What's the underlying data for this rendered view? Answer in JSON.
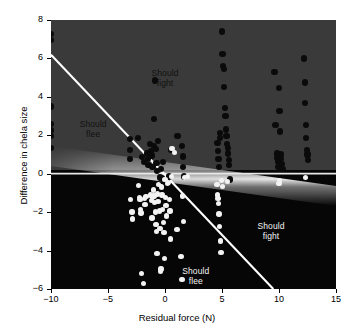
{
  "figure": {
    "background": "#ffffff",
    "plot_bg_upper": "#3a3a3a",
    "plot_bg_lower": "#060606",
    "line_color": "#ffffff"
  },
  "axes": {
    "x": {
      "title": "Residual force (N)",
      "ticks": [
        -10,
        -5,
        0,
        5,
        10,
        15
      ],
      "tick_labels": [
        "−10",
        "−5",
        "0",
        "5",
        "10",
        "15"
      ],
      "min": -10,
      "max": 15
    },
    "y": {
      "title": "Difference in chela size",
      "ticks": [
        8,
        6,
        4,
        2,
        0,
        -2,
        -4,
        -6
      ],
      "tick_labels": [
        "8",
        "6",
        "4",
        "2",
        "0",
        "−2",
        "−4",
        "−6"
      ],
      "min": -6,
      "max": 8
    }
  },
  "annotations": [
    {
      "name": "should-fight-upper",
      "text": "Should\nfight",
      "x": 0.0,
      "y": 5.0,
      "tone": "on-gray"
    },
    {
      "name": "should-flee-upper",
      "text": "Should\nflee",
      "x": -6.3,
      "y": 2.35,
      "tone": "on-gray"
    },
    {
      "name": "should-fight-lower",
      "text": "Should\nfight",
      "x": 9.3,
      "y": -3.0,
      "tone": "on-black"
    },
    {
      "name": "should-flee-lower",
      "text": "Should\nflee",
      "x": 2.7,
      "y": -5.3,
      "tone": "on-black"
    }
  ],
  "chart_data": {
    "type": "scatter",
    "title": "",
    "xlabel": "Residual force (N)",
    "ylabel": "Difference in chela size",
    "xlim": [
      -10,
      15
    ],
    "ylim": [
      -6,
      8
    ],
    "grid": false,
    "legend": null,
    "series": [
      {
        "name": "Winner larger chela (dark points)",
        "marker": "filled-circle",
        "color": "#0a0a0a",
        "points": [
          [
            -10.0,
            7.25
          ],
          [
            -10.0,
            6.95
          ],
          [
            -10.0,
            3.5
          ],
          [
            -10.0,
            2.6
          ],
          [
            -10.0,
            2.25
          ],
          [
            -10.0,
            1.95
          ],
          [
            -10.0,
            1.35
          ],
          [
            -3.05,
            1.8
          ],
          [
            -3.05,
            1.25
          ],
          [
            -3.05,
            0.75
          ],
          [
            -2.35,
            1.85
          ],
          [
            -2.0,
            0.85
          ],
          [
            -1.85,
            0.6
          ],
          [
            -1.55,
            1.05
          ],
          [
            -1.5,
            0.75
          ],
          [
            -1.45,
            0.45
          ],
          [
            -1.3,
            1.55
          ],
          [
            -1.2,
            1.2
          ],
          [
            -1.15,
            0.95
          ],
          [
            -1.1,
            0.35
          ],
          [
            -1.0,
            1.45
          ],
          [
            -0.95,
            2.85
          ],
          [
            -0.9,
            4.85
          ],
          [
            -0.8,
            1.3
          ],
          [
            -0.75,
            0.55
          ],
          [
            -0.7,
            0.15
          ],
          [
            -0.6,
            1.7
          ],
          [
            -0.45,
            -0.2
          ],
          [
            -0.35,
            0.25
          ],
          [
            -0.25,
            -0.25
          ],
          [
            -0.2,
            0.6
          ],
          [
            0.15,
            -0.35
          ],
          [
            0.35,
            -0.15
          ],
          [
            0.55,
            1.25
          ],
          [
            1.1,
            1.95
          ],
          [
            1.5,
            1.45
          ],
          [
            1.55,
            0.9
          ],
          [
            1.6,
            0.35
          ],
          [
            1.65,
            -0.15
          ],
          [
            4.6,
            1.6
          ],
          [
            4.65,
            1.2
          ],
          [
            4.7,
            0.75
          ],
          [
            4.75,
            0.35
          ],
          [
            4.8,
            2.1
          ],
          [
            4.85,
            1.85
          ],
          [
            5.0,
            7.4
          ],
          [
            5.05,
            6.25
          ],
          [
            5.1,
            5.6
          ],
          [
            5.15,
            5.45
          ],
          [
            5.2,
            4.5
          ],
          [
            5.25,
            3.4
          ],
          [
            5.3,
            3.0
          ],
          [
            5.35,
            2.3
          ],
          [
            5.4,
            1.95
          ],
          [
            5.45,
            1.55
          ],
          [
            5.5,
            1.35
          ],
          [
            5.55,
            1.05
          ],
          [
            5.6,
            0.7
          ],
          [
            5.65,
            0.45
          ],
          [
            5.7,
            -0.3
          ],
          [
            9.6,
            5.3
          ],
          [
            9.7,
            2.55
          ],
          [
            9.8,
            1.05
          ],
          [
            9.85,
            0.8
          ],
          [
            9.9,
            0.6
          ],
          [
            9.95,
            0.35
          ],
          [
            10.0,
            4.45
          ],
          [
            10.05,
            3.25
          ],
          [
            10.1,
            2.2
          ],
          [
            10.15,
            1.0
          ],
          [
            10.2,
            0.75
          ],
          [
            10.25,
            0.5
          ],
          [
            10.3,
            0.25
          ],
          [
            12.2,
            6.0
          ],
          [
            12.25,
            4.75
          ],
          [
            12.3,
            3.7
          ],
          [
            12.35,
            2.55
          ],
          [
            12.4,
            1.85
          ],
          [
            12.45,
            1.25
          ],
          [
            12.5,
            1.0
          ],
          [
            12.55,
            0.7
          ]
        ]
      },
      {
        "name": "Loser larger chela (open points)",
        "marker": "open-circle",
        "color": "#f2f2f2",
        "points": [
          [
            -3.0,
            -1.35
          ],
          [
            -2.9,
            -2.0
          ],
          [
            -2.85,
            -2.35
          ],
          [
            -2.3,
            -0.6
          ],
          [
            -2.25,
            -1.25
          ],
          [
            -2.2,
            -1.35
          ],
          [
            -2.15,
            -1.85
          ],
          [
            -2.1,
            -2.05
          ],
          [
            -2.05,
            -5.2
          ],
          [
            -1.9,
            -5.7
          ],
          [
            -1.8,
            -1.3
          ],
          [
            -1.75,
            -1.6
          ],
          [
            -1.65,
            -1.2
          ],
          [
            -1.25,
            -1.1
          ],
          [
            -1.2,
            -1.4
          ],
          [
            -1.15,
            -2.3
          ],
          [
            -1.1,
            -1.25
          ],
          [
            -1.0,
            -0.85
          ],
          [
            -0.95,
            -1.15
          ],
          [
            -0.9,
            -1.5
          ],
          [
            -0.85,
            -2.0
          ],
          [
            -0.8,
            -2.65
          ],
          [
            -0.75,
            -3.0
          ],
          [
            -0.7,
            -4.15
          ],
          [
            -0.65,
            -1.05
          ],
          [
            -0.6,
            -1.45
          ],
          [
            -0.55,
            -0.55
          ],
          [
            -0.5,
            -1.95
          ],
          [
            -0.45,
            -2.85
          ],
          [
            -0.4,
            -5.1
          ],
          [
            -0.35,
            -4.95
          ],
          [
            -0.3,
            -0.7
          ],
          [
            -0.25,
            -1.1
          ],
          [
            -0.2,
            -1.85
          ],
          [
            -0.15,
            -2.55
          ],
          [
            -0.1,
            -3.05
          ],
          [
            -0.05,
            -4.4
          ],
          [
            0.0,
            -0.3
          ],
          [
            0.05,
            -1.25
          ],
          [
            0.1,
            -1.65
          ],
          [
            0.15,
            -2.2
          ],
          [
            0.2,
            -0.5
          ],
          [
            0.3,
            -0.45
          ],
          [
            0.4,
            -1.35
          ],
          [
            0.45,
            -1.95
          ],
          [
            0.5,
            -3.4
          ],
          [
            0.55,
            -0.15
          ],
          [
            0.6,
            1.3
          ],
          [
            0.85,
            1.1
          ],
          [
            1.05,
            -2.9
          ],
          [
            1.4,
            -4.3
          ],
          [
            1.5,
            -5.5
          ],
          [
            1.55,
            -1.15
          ],
          [
            1.6,
            -2.5
          ],
          [
            1.7,
            -0.2
          ],
          [
            2.0,
            -0.15
          ],
          [
            4.55,
            -0.55
          ],
          [
            4.6,
            -1.1
          ],
          [
            4.65,
            -1.3
          ],
          [
            4.7,
            -1.55
          ],
          [
            4.75,
            -2.1
          ],
          [
            4.8,
            -2.75
          ],
          [
            4.85,
            -3.5
          ],
          [
            4.9,
            -4.1
          ],
          [
            4.95,
            -0.35
          ],
          [
            5.05,
            -0.65
          ],
          [
            5.5,
            -0.4
          ],
          [
            10.0,
            -0.5
          ],
          [
            10.05,
            -0.35
          ],
          [
            12.3,
            -0.2
          ]
        ]
      }
    ],
    "lines": [
      {
        "name": "decision-boundary-diagonal",
        "style": "solid",
        "color": "#ffffff",
        "width": 2,
        "from": [
          -10.0,
          6.2
        ],
        "to": [
          9.5,
          -6.0
        ]
      },
      {
        "name": "zero-reference-horizontal",
        "style": "solid",
        "color": "#ffffff",
        "width": 1.6,
        "from": [
          -10.0,
          0.0
        ],
        "to": [
          15.0,
          0.0
        ]
      },
      {
        "name": "shading-boundary-glow",
        "style": "gradient-band",
        "color": "#ffffff",
        "from": [
          -10.0,
          0.7
        ],
        "to": [
          15.0,
          -1.7
        ]
      }
    ]
  }
}
